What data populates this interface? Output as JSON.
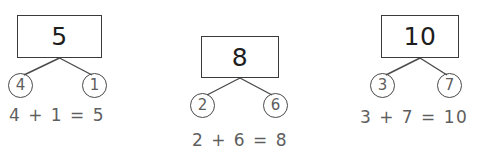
{
  "worksheet": {
    "type": "number-bond-worksheet",
    "background_color": "#ffffff",
    "ink_color": "#3a3a3a",
    "text_color": "#5e5e5e",
    "bonds": [
      {
        "id": "bond-1",
        "whole": "5",
        "part_left": "4",
        "part_right": "1",
        "equation": "4 + 1 = 5"
      },
      {
        "id": "bond-2",
        "whole": "8",
        "part_left": "2",
        "part_right": "6",
        "equation": "2 + 6 = 8"
      },
      {
        "id": "bond-3",
        "whole": "10",
        "part_left": "3",
        "part_right": "7",
        "equation": "3 + 7 = 10"
      }
    ]
  }
}
